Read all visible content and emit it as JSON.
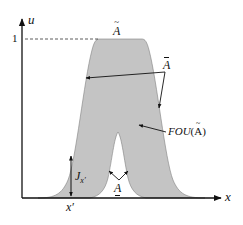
{
  "figure": {
    "type": "interval type-2 fuzzy set diagram",
    "colors": {
      "fou_fill": "#c4c4c4",
      "fou_edge": "#707070",
      "axis": "#111111",
      "background": "#ffffff"
    },
    "axes": {
      "y_label": "u",
      "x_label": "x",
      "y_tick_label": "1"
    },
    "labels": {
      "tilde_A": "A",
      "upper_mf": "A",
      "fou_prefix": "FOU",
      "fou_arg_open": "(",
      "fou_arg": "A",
      "fou_arg_close": ")",
      "j_main": "J",
      "j_sub": "x′",
      "lower_mf": "A",
      "x_prime": "x′"
    },
    "annotations": [
      "Ã marks the type-2 fuzzy set at membership 1",
      "Ā arrows point to the upper membership function",
      "FOU(Ã) arrow points to the shaded footprint of uncertainty",
      "J_x′ vertical double arrow spans the primary membership at x′",
      "A̲ arrows point to the lower membership function"
    ]
  }
}
